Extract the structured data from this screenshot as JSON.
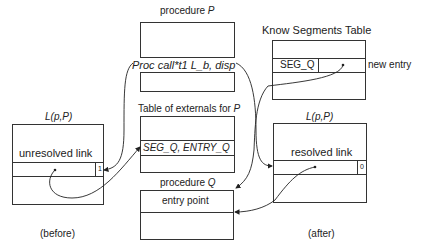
{
  "procedure_p": {
    "title_prefix": "procedure ",
    "title_var": "P",
    "call_label": "Proc call*t1 L_b, disp"
  },
  "externals_table": {
    "title_prefix": "Table of externals for ",
    "title_var": "P",
    "entry": "SEG_Q, ENTRY_Q"
  },
  "procedure_q": {
    "title_prefix": "procedure ",
    "title_var": "Q",
    "entry_label": "entry point"
  },
  "known_segments": {
    "title": "Know Segments Table",
    "entry": "SEG_Q",
    "annotation": "new entry"
  },
  "linkage_before": {
    "title": "L(p,P)",
    "label": "unresolved link",
    "flag": "1",
    "caption": "(before)"
  },
  "linkage_after": {
    "title": "L(p,P)",
    "label": "resolved link",
    "flag": "0",
    "caption": "(after)"
  }
}
